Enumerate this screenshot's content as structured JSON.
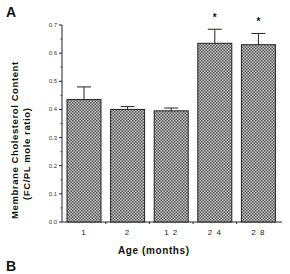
{
  "panel": {
    "label": "A",
    "next_panel_label": "B"
  },
  "chart_data": {
    "type": "bar",
    "title": "",
    "xlabel": "Age  (months)",
    "ylabel_line1": "Membrane  Cholesterol  Content",
    "ylabel_line2": "(FC/PL  mole  ratio)",
    "categories": [
      "1",
      "2",
      "12",
      "24",
      "28"
    ],
    "values": [
      0.435,
      0.4,
      0.395,
      0.635,
      0.63
    ],
    "error_upper": [
      0.48,
      0.41,
      0.405,
      0.685,
      0.67
    ],
    "significance": [
      "",
      "",
      "",
      "*",
      "*"
    ],
    "yticks": [
      "0.0",
      "0.1",
      "0.2",
      "0.3",
      "0.4",
      "0.5",
      "0.6",
      "0.7"
    ],
    "ylim": [
      0,
      0.7
    ],
    "grid": false,
    "legend": null,
    "bar_fill": "#9a9a9a",
    "bar_pattern": "crosshatch-dots"
  }
}
